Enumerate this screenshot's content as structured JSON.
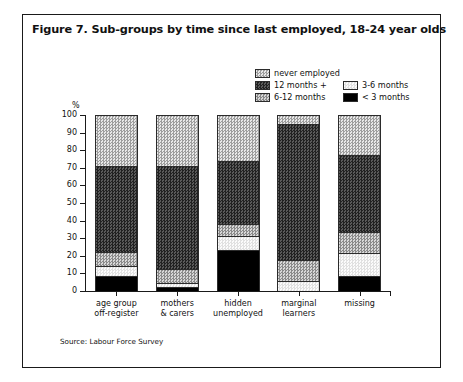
{
  "figure": {
    "title": "Figure 7. Sub-groups by time since last employed, 18-24 year olds",
    "source": "Source: Labour Force Survey",
    "axis_unit": "%"
  },
  "legend": {
    "rows": [
      {
        "left": {
          "label": "never employed",
          "pattern": "p-never"
        },
        "right": null
      },
      {
        "left": {
          "label": "12 months +",
          "pattern": "p-12plus"
        },
        "right": {
          "label": "3-6 months",
          "pattern": "p-36"
        }
      },
      {
        "left": {
          "label": "6-12 months",
          "pattern": "p-612"
        },
        "right": {
          "label": "< 3 months",
          "pattern": "p-lt3"
        }
      }
    ]
  },
  "chart_data": {
    "type": "bar",
    "subtype": "stacked-100-percent",
    "title": "Figure 7. Sub-groups by time since last employed, 18-24 year olds",
    "xlabel": "",
    "ylabel": "%",
    "ylim": [
      0,
      100
    ],
    "yticks": [
      0,
      10,
      20,
      30,
      40,
      50,
      60,
      70,
      80,
      90,
      100
    ],
    "grid": false,
    "legend_position": "top-right",
    "categories": [
      "age group off-register",
      "mothers & carers",
      "hidden unemployed",
      "marginal learners",
      "missing"
    ],
    "category_lines": [
      [
        "age group",
        "off-register"
      ],
      [
        "mothers",
        "& carers"
      ],
      [
        "hidden",
        "unemployed"
      ],
      [
        "marginal",
        "learners"
      ],
      [
        "missing"
      ]
    ],
    "series": [
      {
        "name": "< 3 months",
        "pattern": "p-lt3",
        "values": [
          8,
          2,
          23,
          0,
          8
        ]
      },
      {
        "name": "3-6 months",
        "pattern": "p-36",
        "values": [
          6,
          2,
          8,
          5,
          13
        ]
      },
      {
        "name": "6-12 months",
        "pattern": "p-612",
        "values": [
          8,
          8,
          7,
          12,
          12
        ]
      },
      {
        "name": "12 months +",
        "pattern": "p-12plus",
        "values": [
          49,
          59,
          36,
          78,
          44
        ]
      },
      {
        "name": "never employed",
        "pattern": "p-never",
        "values": [
          29,
          29,
          26,
          5,
          23
        ]
      }
    ]
  }
}
